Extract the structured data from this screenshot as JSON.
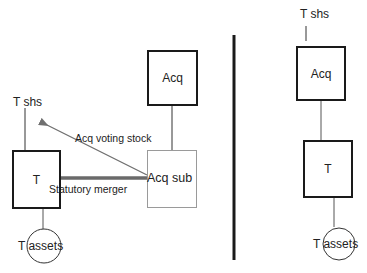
{
  "diagram": {
    "left": {
      "title": "Before: forward/reverse triangular merger structure",
      "target_shareholders": {
        "label": "T shs"
      },
      "target_box": {
        "label": "T"
      },
      "target_assets": {
        "label": "T assets"
      },
      "acquirer_box": {
        "label": "Acq"
      },
      "acquirer_sub_box": {
        "label": "Acq sub"
      },
      "arrows": [
        {
          "from": "Acq sub",
          "to": "T shs",
          "label": "Acq voting stock",
          "style": "thin-gray"
        },
        {
          "from": "Acq sub",
          "to": "T",
          "label": "Statutory merger",
          "style": "thick-gray"
        }
      ]
    },
    "divider": {
      "orientation": "vertical"
    },
    "right": {
      "target_shareholders": {
        "label": "T shs"
      },
      "acquirer_box": {
        "label": "Acq"
      },
      "target_box": {
        "label": "T"
      },
      "target_assets": {
        "label": "T assets"
      }
    }
  },
  "colors": {
    "box_border": "#1a1a1a",
    "sub_box_border": "#9a9a9a",
    "arrow": "#707070",
    "connector": "#333333",
    "text": "#222222"
  }
}
